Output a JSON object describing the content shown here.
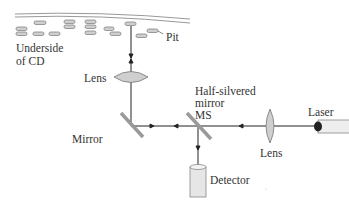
{
  "diagram": {
    "labels": {
      "pit": "Pit",
      "underside_line1": "Underside",
      "underside_line2": "of CD",
      "lens_top": "Lens",
      "half_silvered_line1": "Half-silvered",
      "half_silvered_line2": "mirror",
      "half_silvered_line3": "MS",
      "laser": "Laser",
      "mirror": "Mirror",
      "lens_right": "Lens",
      "detector": "Detector"
    },
    "colors": {
      "pit_fill": "#c8c8c8",
      "lens_fill": "#cfcfcf",
      "mirror": "#999999",
      "beam": "#222222",
      "disc_edge": "#888888"
    }
  }
}
